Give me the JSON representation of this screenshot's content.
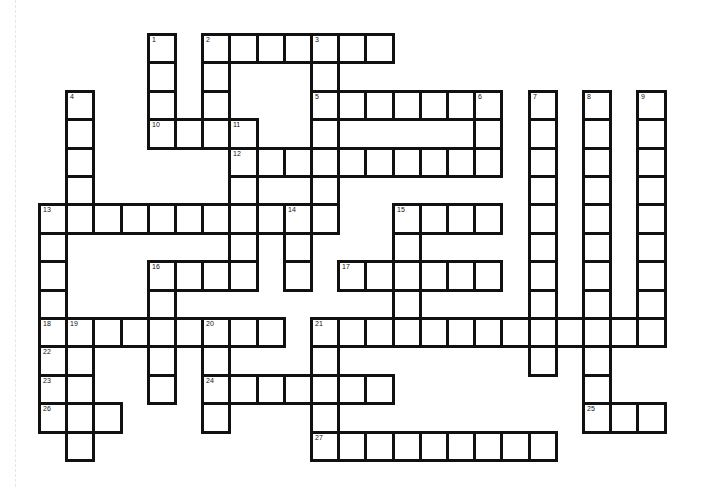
{
  "puzzle": {
    "grid": {
      "origin_x": 38,
      "origin_y": 33,
      "cell_w": 27.2,
      "cell_h": 28.4,
      "border_color": "#111111",
      "fill_color": "#ffffff"
    },
    "across": [
      {
        "number": "2",
        "row": 0,
        "col": 6,
        "length": 7
      },
      {
        "number": "5",
        "row": 2,
        "col": 10,
        "length": 7
      },
      {
        "number": "10",
        "row": 3,
        "col": 4,
        "length": 4
      },
      {
        "number": "12",
        "row": 4,
        "col": 7,
        "length": 10
      },
      {
        "number": "13",
        "row": 6,
        "col": 0,
        "length": 11
      },
      {
        "number": "15",
        "row": 6,
        "col": 13,
        "length": 4
      },
      {
        "number": "16",
        "row": 8,
        "col": 4,
        "length": 4
      },
      {
        "number": "17",
        "row": 8,
        "col": 11,
        "length": 6
      },
      {
        "number": "18",
        "row": 10,
        "col": 0,
        "length": 9
      },
      {
        "number": "21",
        "row": 10,
        "col": 10,
        "length": 13
      },
      {
        "number": "22",
        "row": 11,
        "col": 0,
        "length": 2
      },
      {
        "number": "23",
        "row": 12,
        "col": 0,
        "length": 2
      },
      {
        "number": "24",
        "row": 12,
        "col": 6,
        "length": 7
      },
      {
        "number": "25",
        "row": 13,
        "col": 20,
        "length": 3
      },
      {
        "number": "26",
        "row": 13,
        "col": 0,
        "length": 3
      },
      {
        "number": "27",
        "row": 14,
        "col": 10,
        "length": 9
      }
    ],
    "down": [
      {
        "number": "1",
        "row": 0,
        "col": 4,
        "length": 4
      },
      {
        "number": "2",
        "row": 0,
        "col": 6,
        "length": 4
      },
      {
        "number": "3",
        "row": 0,
        "col": 10,
        "length": 7
      },
      {
        "number": "4",
        "row": 2,
        "col": 1,
        "length": 5
      },
      {
        "number": "6",
        "row": 2,
        "col": 16,
        "length": 3
      },
      {
        "number": "7",
        "row": 2,
        "col": 18,
        "length": 10
      },
      {
        "number": "8",
        "row": 2,
        "col": 20,
        "length": 12
      },
      {
        "number": "9",
        "row": 2,
        "col": 22,
        "length": 9
      },
      {
        "number": "11",
        "row": 3,
        "col": 7,
        "length": 6
      },
      {
        "number": "13",
        "row": 6,
        "col": 0,
        "length": 8
      },
      {
        "number": "14",
        "row": 6,
        "col": 9,
        "length": 3
      },
      {
        "number": "15",
        "row": 6,
        "col": 13,
        "length": 5
      },
      {
        "number": "16",
        "row": 8,
        "col": 4,
        "length": 5
      },
      {
        "number": "19",
        "row": 10,
        "col": 1,
        "length": 5
      },
      {
        "number": "20",
        "row": 10,
        "col": 6,
        "length": 4
      },
      {
        "number": "21",
        "row": 10,
        "col": 10,
        "length": 5
      }
    ]
  }
}
